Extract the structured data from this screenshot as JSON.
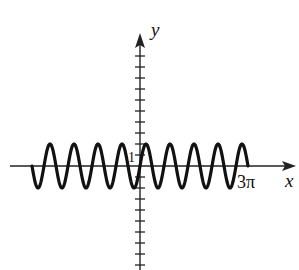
{
  "chart_data": {
    "type": "line",
    "title": "",
    "function": "y = 2 sin(3x)",
    "xlabel": "x",
    "ylabel": "y",
    "x_domain": [
      -9.4248,
      9.4248
    ],
    "x_tick_labels": [
      {
        "value": 9.4248,
        "label": "3π"
      }
    ],
    "y_tick_labels": [
      {
        "value": 1,
        "label": "1"
      }
    ],
    "y_ticks_above_axis": 10,
    "y_ticks_below_axis": 9,
    "amplitude": 2,
    "period": 2.0944,
    "grid": false,
    "legend": null,
    "series": [
      {
        "name": "curve",
        "x": [
          -9.4248,
          -8.9012,
          -8.3776,
          -7.854,
          -7.3304,
          -6.8068,
          -6.2832,
          -5.7596,
          -5.236,
          -4.7124,
          -4.1888,
          -3.6652,
          -3.1416,
          -2.618,
          -2.0944,
          -1.5708,
          -1.0472,
          -0.5236,
          0,
          0.5236,
          1.0472,
          1.5708,
          2.0944,
          2.618,
          3.1416,
          3.6652,
          4.1888,
          4.7124,
          5.236,
          5.7596,
          6.2832,
          6.8068,
          7.3304,
          7.854,
          8.3776,
          8.9012,
          9.4248
        ],
        "y": [
          0,
          -2,
          0,
          2,
          0,
          -2,
          0,
          2,
          0,
          -2,
          0,
          2,
          0,
          -2,
          0,
          2,
          0,
          -2,
          0,
          2,
          0,
          -2,
          0,
          2,
          0,
          -2,
          0,
          2,
          0,
          -2,
          0,
          2,
          0,
          -2,
          0,
          2,
          0
        ]
      }
    ]
  },
  "labels": {
    "x_axis": "x",
    "y_axis": "y",
    "y_unit": "1",
    "x_end": "3π"
  },
  "colors": {
    "curve": "#111111",
    "axis": "#222222",
    "background": "#ffffff"
  }
}
